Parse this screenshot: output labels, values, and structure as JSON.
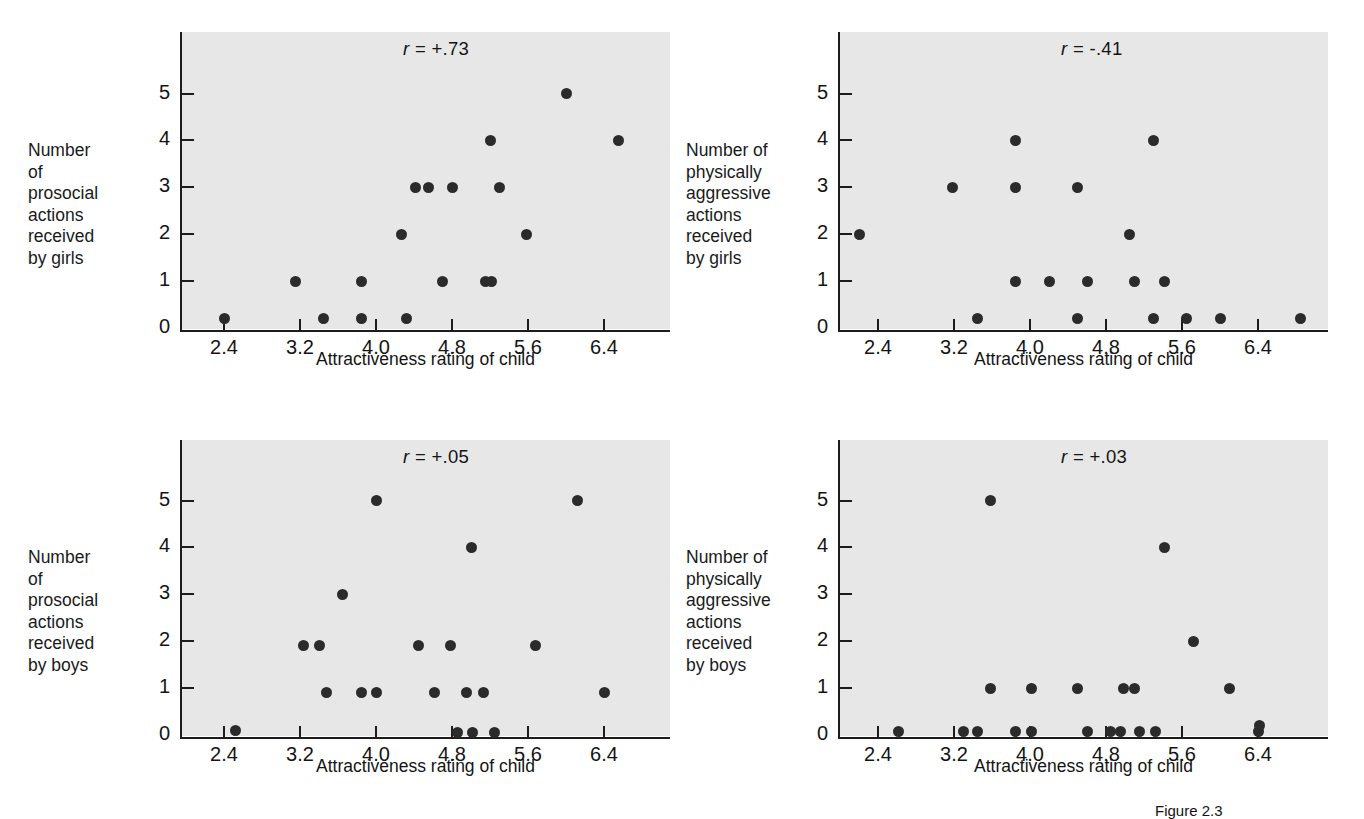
{
  "figure": {
    "caption": "Figure 2.3",
    "xaxis_title": "Attractiveness rating of child",
    "xticks": [
      "2.4",
      "3.2",
      "4.0",
      "4.8",
      "5.6",
      "6.4"
    ],
    "yticks": [
      "0",
      "1",
      "2",
      "3",
      "4",
      "5"
    ]
  },
  "chart_data": [
    {
      "type": "scatter",
      "panel": "top-left",
      "title": "",
      "annotation": "r = +.73",
      "r_value": "+.73",
      "xlabel": "Attractiveness rating of child",
      "ylabel": "Number of prosocial actions received by girls",
      "ylabel_lines": [
        "Number of",
        "prosocial",
        "actions",
        "received",
        "by girls"
      ],
      "xlim": [
        2.0,
        6.95
      ],
      "ylim": [
        0,
        5.75
      ],
      "xticks": [
        2.4,
        3.2,
        4.0,
        4.8,
        5.6,
        6.4
      ],
      "yticks": [
        0,
        1,
        2,
        3,
        4,
        5
      ],
      "grid": false,
      "points": [
        {
          "x": 2.4,
          "y": 0.2
        },
        {
          "x": 3.15,
          "y": 1.0
        },
        {
          "x": 3.45,
          "y": 0.2
        },
        {
          "x": 3.85,
          "y": 1.0
        },
        {
          "x": 3.85,
          "y": 0.2
        },
        {
          "x": 4.27,
          "y": 2.0
        },
        {
          "x": 4.32,
          "y": 0.2
        },
        {
          "x": 4.42,
          "y": 3.0
        },
        {
          "x": 4.55,
          "y": 3.0
        },
        {
          "x": 4.7,
          "y": 1.0
        },
        {
          "x": 4.8,
          "y": 3.0
        },
        {
          "x": 5.15,
          "y": 1.0
        },
        {
          "x": 5.2,
          "y": 4.0
        },
        {
          "x": 5.22,
          "y": 1.0
        },
        {
          "x": 5.3,
          "y": 3.0
        },
        {
          "x": 5.58,
          "y": 2.0
        },
        {
          "x": 6.0,
          "y": 5.0
        },
        {
          "x": 6.55,
          "y": 4.0
        }
      ]
    },
    {
      "type": "scatter",
      "panel": "top-right",
      "title": "",
      "annotation": "r = -.41",
      "r_value": "-.41",
      "xlabel": "Attractiveness rating of child",
      "ylabel": "Number of physically aggressive actions received by girls",
      "ylabel_lines": [
        "Number of",
        "physically",
        "aggressive",
        "actions",
        "received",
        "by girls"
      ],
      "xlim": [
        2.0,
        6.95
      ],
      "ylim": [
        0,
        5.75
      ],
      "xticks": [
        2.4,
        3.2,
        4.0,
        4.8,
        5.6,
        6.4
      ],
      "yticks": [
        0,
        1,
        2,
        3,
        4,
        5
      ],
      "grid": false,
      "points": [
        {
          "x": 2.2,
          "y": 2.0
        },
        {
          "x": 3.18,
          "y": 3.0
        },
        {
          "x": 3.45,
          "y": 0.2
        },
        {
          "x": 3.85,
          "y": 4.0
        },
        {
          "x": 3.85,
          "y": 3.0
        },
        {
          "x": 3.85,
          "y": 1.0
        },
        {
          "x": 4.2,
          "y": 1.0
        },
        {
          "x": 4.5,
          "y": 3.0
        },
        {
          "x": 4.5,
          "y": 0.2
        },
        {
          "x": 4.6,
          "y": 1.0
        },
        {
          "x": 5.05,
          "y": 2.0
        },
        {
          "x": 5.1,
          "y": 1.0
        },
        {
          "x": 5.3,
          "y": 4.0
        },
        {
          "x": 5.3,
          "y": 0.2
        },
        {
          "x": 5.42,
          "y": 1.0
        },
        {
          "x": 5.65,
          "y": 0.2
        },
        {
          "x": 6.0,
          "y": 0.2
        },
        {
          "x": 6.85,
          "y": 0.2
        }
      ]
    },
    {
      "type": "scatter",
      "panel": "bottom-left",
      "title": "",
      "annotation": "r = +.05",
      "r_value": "+.05",
      "xlabel": "Attractiveness rating of child",
      "ylabel": "Number of prosocial actions received by boys",
      "ylabel_lines": [
        "Number of",
        "prosocial",
        "actions",
        "received",
        "by boys"
      ],
      "xlim": [
        2.0,
        6.95
      ],
      "ylim": [
        0,
        5.75
      ],
      "xticks": [
        2.4,
        3.2,
        4.0,
        4.8,
        5.6,
        6.4
      ],
      "yticks": [
        0,
        1,
        2,
        3,
        4,
        5
      ],
      "grid": false,
      "points": [
        {
          "x": 2.52,
          "y": 0.1
        },
        {
          "x": 3.24,
          "y": 1.9
        },
        {
          "x": 3.4,
          "y": 1.9
        },
        {
          "x": 3.48,
          "y": 0.9
        },
        {
          "x": 3.65,
          "y": 3.0
        },
        {
          "x": 3.85,
          "y": 0.9
        },
        {
          "x": 4.0,
          "y": 5.0
        },
        {
          "x": 4.0,
          "y": 0.9
        },
        {
          "x": 4.45,
          "y": 1.9
        },
        {
          "x": 4.62,
          "y": 0.9
        },
        {
          "x": 4.78,
          "y": 1.9
        },
        {
          "x": 4.86,
          "y": 0.05
        },
        {
          "x": 4.95,
          "y": 0.9
        },
        {
          "x": 5.0,
          "y": 4.0
        },
        {
          "x": 5.02,
          "y": 0.05
        },
        {
          "x": 5.13,
          "y": 0.9
        },
        {
          "x": 5.25,
          "y": 0.05
        },
        {
          "x": 5.68,
          "y": 1.9
        },
        {
          "x": 6.12,
          "y": 5.0
        },
        {
          "x": 6.4,
          "y": 0.9
        }
      ]
    },
    {
      "type": "scatter",
      "panel": "bottom-right",
      "title": "",
      "annotation": "r = +.03",
      "r_value": "+.03",
      "xlabel": "Attractiveness rating of child",
      "ylabel": "Number of physically aggressive actions received by boys",
      "ylabel_lines": [
        "Number of",
        "physically",
        "aggressive",
        "actions",
        "received",
        "by boys"
      ],
      "xlim": [
        2.0,
        6.95
      ],
      "ylim": [
        0,
        5.75
      ],
      "xticks": [
        2.4,
        3.2,
        4.0,
        4.8,
        5.6,
        6.4
      ],
      "yticks": [
        0,
        1,
        2,
        3,
        4,
        5
      ],
      "grid": false,
      "points": [
        {
          "x": 2.62,
          "y": 0.08
        },
        {
          "x": 3.3,
          "y": 0.08
        },
        {
          "x": 3.45,
          "y": 0.08
        },
        {
          "x": 3.58,
          "y": 5.0
        },
        {
          "x": 3.58,
          "y": 1.0
        },
        {
          "x": 3.85,
          "y": 0.08
        },
        {
          "x": 4.02,
          "y": 0.08
        },
        {
          "x": 4.02,
          "y": 1.0
        },
        {
          "x": 4.5,
          "y": 1.0
        },
        {
          "x": 4.6,
          "y": 0.08
        },
        {
          "x": 4.85,
          "y": 0.08
        },
        {
          "x": 4.95,
          "y": 0.08
        },
        {
          "x": 4.98,
          "y": 1.0
        },
        {
          "x": 5.1,
          "y": 1.0
        },
        {
          "x": 5.15,
          "y": 0.08
        },
        {
          "x": 5.32,
          "y": 0.08
        },
        {
          "x": 5.42,
          "y": 4.0
        },
        {
          "x": 5.72,
          "y": 2.0
        },
        {
          "x": 6.1,
          "y": 1.0
        },
        {
          "x": 6.4,
          "y": 0.08
        },
        {
          "x": 6.42,
          "y": 0.2
        }
      ]
    }
  ]
}
